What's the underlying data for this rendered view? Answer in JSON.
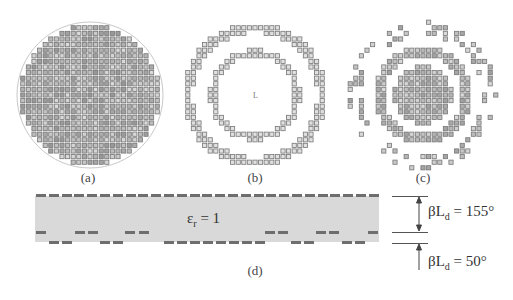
{
  "figure": {
    "panels": [
      {
        "id": "a",
        "label": "(a)",
        "description": "full circular array of square elements",
        "center": [
          90,
          95
        ],
        "radius": 73
      },
      {
        "id": "b",
        "label": "(b)",
        "description": "two concentric rings of elements with center feed mark",
        "center": [
          255,
          95
        ]
      },
      {
        "id": "c",
        "label": "(c)",
        "description": "concentric ring clusters of elements",
        "center": [
          423,
          95
        ]
      }
    ],
    "cross_section": {
      "label": "(d)",
      "dielectric_label": "ε",
      "dielectric_sub": "r",
      "dielectric_value": " = 1",
      "dimensions": [
        {
          "prefix": "βL",
          "sub": "d",
          "value": " = 155°"
        },
        {
          "prefix": "βL",
          "sub": "d",
          "value": " = 50°"
        }
      ]
    },
    "colors": {
      "element": "#777777",
      "element_fill": "#bdbdbd",
      "circle_outline": "#c8c8c8",
      "dielectric": "#d9d9d9",
      "strip": "#6e6e6e"
    }
  }
}
